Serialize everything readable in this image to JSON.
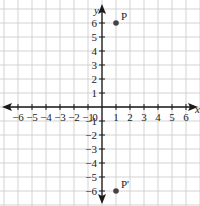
{
  "chart_data": {
    "type": "scatter",
    "title": "",
    "xlabel": "x",
    "ylabel": "y",
    "xlim": [
      -6,
      6
    ],
    "ylim": [
      -6,
      6
    ],
    "grid": true,
    "x_ticks": [
      -6,
      -5,
      -4,
      -3,
      -2,
      -1,
      1,
      2,
      3,
      4,
      5,
      6
    ],
    "y_ticks": [
      6,
      5,
      4,
      3,
      2,
      1,
      -1,
      -2,
      -3,
      -4,
      -5,
      -6
    ],
    "origin_label": "0",
    "points": [
      {
        "label": "P",
        "x": 1,
        "y": 6
      },
      {
        "label": "P'",
        "x": 1,
        "y": -6
      }
    ]
  },
  "colors": {
    "grid": "#c8c8c8",
    "axis": "#1a1a1a",
    "point": "#444444"
  }
}
